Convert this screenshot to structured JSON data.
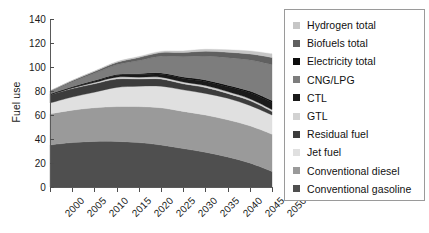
{
  "chart_data": {
    "type": "area",
    "stacked": true,
    "title": "",
    "xlabel": "",
    "ylabel": "Fuel use",
    "x": [
      2000,
      2005,
      2010,
      2015,
      2020,
      2025,
      2030,
      2035,
      2040,
      2045,
      2050
    ],
    "xlim": [
      2000,
      2050
    ],
    "ylim": [
      0,
      140
    ],
    "xticks": [
      "2000",
      "2005",
      "2010",
      "2015",
      "2020",
      "2025",
      "2030",
      "2035",
      "2040",
      "2045",
      "2050"
    ],
    "yticks": [
      "0",
      "20",
      "40",
      "60",
      "80",
      "100",
      "120",
      "140"
    ],
    "grid": false,
    "legend_position": "right",
    "series": [
      {
        "name": "Conventional gasoline",
        "color": "#4f4f4f",
        "values": [
          35,
          37,
          38,
          38,
          37,
          35,
          32,
          29,
          25,
          20,
          13
        ]
      },
      {
        "name": "Conventional diesel",
        "color": "#9a9a9a",
        "values": [
          26,
          27,
          28,
          29,
          30,
          31,
          31,
          31,
          31,
          31,
          31
        ]
      },
      {
        "name": "Jet fuel",
        "color": "#e0e0e0",
        "values": [
          9,
          11,
          13,
          16,
          17,
          18,
          18,
          18,
          18,
          17,
          16
        ]
      },
      {
        "name": "Residual fuel",
        "color": "#3c3c3c",
        "values": [
          7,
          7,
          7,
          7,
          6,
          6,
          5,
          5,
          4,
          4,
          3
        ]
      },
      {
        "name": "GTL",
        "color": "#d2d2d2",
        "values": [
          0,
          0.5,
          1,
          1.5,
          1.5,
          1.5,
          1.5,
          1.5,
          1.5,
          1.5,
          1.5
        ]
      },
      {
        "name": "CTL",
        "color": "#1a1a1a",
        "values": [
          0,
          0.5,
          1,
          1.5,
          2,
          2.5,
          3,
          3.5,
          4,
          5,
          6
        ]
      },
      {
        "name": "Electricity total",
        "color": "#0d0d0d",
        "values": [
          0.5,
          0.6,
          0.7,
          0.8,
          0.9,
          1,
          1.1,
          1.2,
          1.3,
          1.4,
          1.5
        ]
      },
      {
        "name": "CNG/LPG",
        "color": "#7d7d7d",
        "values": [
          2,
          4,
          6,
          8,
          11,
          14,
          17,
          20,
          23,
          26,
          30
        ]
      },
      {
        "name": "Biofuels total",
        "color": "#606060",
        "values": [
          0.5,
          1,
          1.5,
          2,
          2.5,
          3,
          3.5,
          4,
          4.5,
          5,
          6
        ]
      },
      {
        "name": "Hydrogen total",
        "color": "#c6c6c6",
        "values": [
          0,
          0.2,
          0.4,
          0.6,
          0.8,
          1,
          1.3,
          1.6,
          2,
          2.5,
          3
        ]
      }
    ]
  },
  "legend": {
    "items": [
      {
        "label": "Hydrogen total",
        "color": "#c6c6c6"
      },
      {
        "label": "Biofuels total",
        "color": "#606060"
      },
      {
        "label": "Electricity total",
        "color": "#0d0d0d"
      },
      {
        "label": "CNG/LPG",
        "color": "#7d7d7d"
      },
      {
        "label": "CTL",
        "color": "#1a1a1a"
      },
      {
        "label": "GTL",
        "color": "#d2d2d2"
      },
      {
        "label": "Residual fuel",
        "color": "#3c3c3c"
      },
      {
        "label": "Jet fuel",
        "color": "#e0e0e0"
      },
      {
        "label": "Conventional diesel",
        "color": "#9a9a9a"
      },
      {
        "label": "Conventional gasoline",
        "color": "#4f4f4f"
      }
    ]
  }
}
